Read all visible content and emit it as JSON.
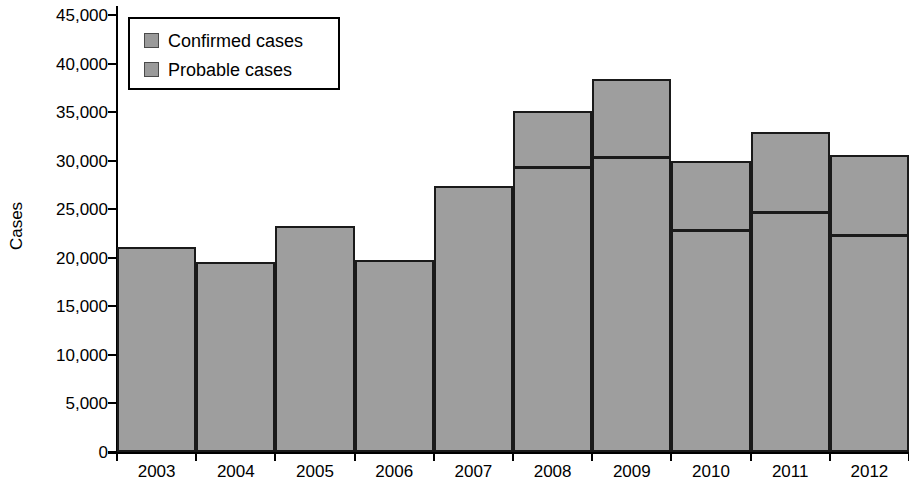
{
  "chart_data": {
    "type": "bar",
    "title": "",
    "subtitle": "",
    "xlabel": "",
    "ylabel": "Cases",
    "stacked": true,
    "grid": false,
    "legend_position": "top-left",
    "categories": [
      "2003",
      "2004",
      "2005",
      "2006",
      "2007",
      "2008",
      "2009",
      "2010",
      "2011",
      "2012"
    ],
    "ylim": [
      0,
      45000
    ],
    "ytick_values": [
      0,
      5000,
      10000,
      15000,
      20000,
      25000,
      30000,
      35000,
      40000,
      45000
    ],
    "ytick_labels": [
      "0",
      "5,000",
      "10,000",
      "15,000",
      "20,000",
      "25,000",
      "30,000",
      "35,000",
      "40,000",
      "45,000"
    ],
    "series": [
      {
        "name": "Confirmed cases",
        "color": "#9e9e9e",
        "values": [
          21100,
          19600,
          23300,
          19800,
          27400,
          28900,
          30000,
          22500,
          24300,
          21900
        ]
      },
      {
        "name": "Probable cases",
        "color": "#9e9e9e",
        "values": [
          0,
          0,
          0,
          0,
          0,
          6200,
          8400,
          7500,
          8700,
          8700
        ]
      }
    ],
    "totals": [
      21100,
      19600,
      23300,
      19800,
      27400,
      35100,
      38400,
      30000,
      33000,
      30600
    ],
    "legend": [
      {
        "label": "Confirmed cases",
        "swatch_color": "#9a9a9a"
      },
      {
        "label": "Probable cases",
        "swatch_color": "#9a9a9a"
      }
    ]
  }
}
